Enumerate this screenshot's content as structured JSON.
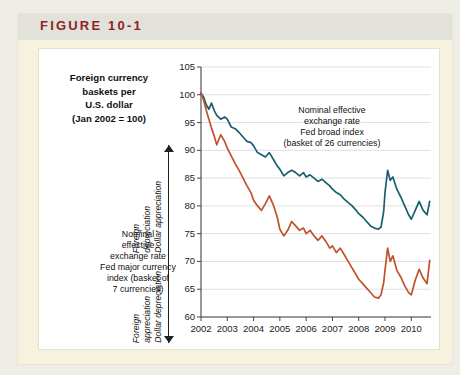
{
  "figure": {
    "label": "FIGURE 10-1",
    "header_bg": "#e2e2da",
    "card_bg": "#f7f2de",
    "label_color": "#8c2427"
  },
  "caption": {
    "line1": "Foreign currency",
    "line2": "baskets per",
    "line3": "U.S. dollar",
    "line4": "(Jan 2002 = 100)"
  },
  "axis_annotations": {
    "upper": {
      "text_a": "Foreign",
      "text_b": "depreciation",
      "text_c": "Dollar appreciation",
      "arrow": "arrow-up"
    },
    "lower": {
      "text_a": "Foreign",
      "text_b": "appreciation",
      "text_c": "Dollar depreciation",
      "arrow": "arrow-down"
    }
  },
  "annotations": {
    "broad": {
      "l1": "Nominal effective",
      "l2": "exchange rate",
      "l3": "Fed broad index",
      "l4": "(basket of 26 currencies)"
    },
    "major": {
      "l1": "Nominal",
      "l2": "effective",
      "l3": "exchange rate",
      "l4": "Fed major currency",
      "l5": "index (basket of",
      "l6": "7 currencies)"
    }
  },
  "chart_data": {
    "type": "line",
    "title": "Foreign currency baskets per U.S. dollar (Jan 2002 = 100)",
    "xlabel": "",
    "ylabel": "Index (Jan 2002 = 100)",
    "xlim": [
      2002.0,
      2010.75
    ],
    "ylim": [
      60,
      105
    ],
    "yticks": [
      60,
      65,
      70,
      75,
      80,
      85,
      90,
      95,
      100,
      105
    ],
    "xticks": [
      2002,
      2003,
      2004,
      2005,
      2006,
      2007,
      2008,
      2009,
      2010
    ],
    "grid": "horizontal",
    "legend": "annotations-on-plot",
    "series": [
      {
        "name": "Nominal effective exchange rate, Fed broad index (basket of 26 currencies)",
        "color": "#1a5f70",
        "x": [
          2002.0,
          2002.1,
          2002.2,
          2002.3,
          2002.4,
          2002.5,
          2002.6,
          2002.75,
          2002.9,
          2003.0,
          2003.15,
          2003.3,
          2003.45,
          2003.6,
          2003.75,
          2003.9,
          2004.0,
          2004.15,
          2004.3,
          2004.45,
          2004.6,
          2004.75,
          2004.9,
          2005.0,
          2005.15,
          2005.3,
          2005.45,
          2005.6,
          2005.75,
          2005.9,
          2006.0,
          2006.15,
          2006.3,
          2006.45,
          2006.6,
          2006.75,
          2006.9,
          2007.0,
          2007.15,
          2007.3,
          2007.45,
          2007.6,
          2007.75,
          2007.9,
          2008.0,
          2008.15,
          2008.3,
          2008.45,
          2008.6,
          2008.75,
          2008.85,
          2008.95,
          2009.0,
          2009.1,
          2009.2,
          2009.3,
          2009.45,
          2009.6,
          2009.75,
          2009.9,
          2010.0,
          2010.15,
          2010.3,
          2010.45,
          2010.6,
          2010.7
        ],
        "y": [
          100.3,
          99.6,
          98.2,
          97.4,
          98.5,
          97.2,
          96.3,
          95.6,
          96.0,
          95.6,
          94.2,
          93.9,
          93.2,
          92.4,
          91.6,
          91.4,
          90.8,
          89.6,
          89.2,
          88.8,
          89.6,
          88.4,
          87.2,
          86.6,
          85.4,
          86.0,
          86.4,
          86.0,
          85.4,
          86.0,
          85.2,
          85.6,
          85.0,
          84.4,
          84.8,
          84.2,
          83.6,
          83.0,
          82.4,
          82.0,
          81.2,
          80.6,
          80.0,
          79.2,
          78.6,
          78.0,
          77.2,
          76.4,
          76.0,
          75.8,
          76.2,
          79.0,
          82.4,
          86.4,
          84.6,
          85.2,
          83.0,
          81.6,
          80.0,
          78.4,
          77.6,
          79.2,
          80.8,
          79.2,
          78.4,
          80.8
        ]
      },
      {
        "name": "Nominal effective exchange rate, Fed major currency index (basket of 7 currencies)",
        "color": "#c0522b",
        "x": [
          2002.0,
          2002.1,
          2002.2,
          2002.3,
          2002.4,
          2002.5,
          2002.6,
          2002.75,
          2002.9,
          2003.0,
          2003.15,
          2003.3,
          2003.45,
          2003.6,
          2003.75,
          2003.9,
          2004.0,
          2004.15,
          2004.3,
          2004.45,
          2004.6,
          2004.75,
          2004.9,
          2005.0,
          2005.15,
          2005.3,
          2005.45,
          2005.6,
          2005.75,
          2005.9,
          2006.0,
          2006.15,
          2006.3,
          2006.45,
          2006.6,
          2006.75,
          2006.9,
          2007.0,
          2007.15,
          2007.3,
          2007.45,
          2007.6,
          2007.75,
          2007.9,
          2008.0,
          2008.15,
          2008.3,
          2008.45,
          2008.6,
          2008.75,
          2008.85,
          2008.95,
          2009.0,
          2009.1,
          2009.2,
          2009.3,
          2009.45,
          2009.6,
          2009.75,
          2009.9,
          2010.0,
          2010.15,
          2010.3,
          2010.45,
          2010.6,
          2010.7
        ],
        "y": [
          100.4,
          99.0,
          97.2,
          95.6,
          94.0,
          92.6,
          91.0,
          92.8,
          91.6,
          90.4,
          89.0,
          87.6,
          86.4,
          85.0,
          83.6,
          82.4,
          81.0,
          80.0,
          79.2,
          80.4,
          81.8,
          80.2,
          78.0,
          75.8,
          74.6,
          75.6,
          77.2,
          76.4,
          75.6,
          76.0,
          75.0,
          75.6,
          74.6,
          73.8,
          74.6,
          73.6,
          72.4,
          72.8,
          71.6,
          72.4,
          71.2,
          70.0,
          68.8,
          67.6,
          66.8,
          66.0,
          65.2,
          64.4,
          63.6,
          63.4,
          64.0,
          66.2,
          68.4,
          72.4,
          70.0,
          71.0,
          68.4,
          67.2,
          65.6,
          64.4,
          64.0,
          66.6,
          68.6,
          67.0,
          66.0,
          70.2
        ]
      }
    ]
  }
}
